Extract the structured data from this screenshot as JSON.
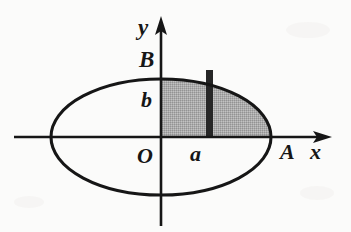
{
  "figure": {
    "background_color": "#fbfbfa",
    "ink_color": "#161616",
    "shade_color": "#a8a8a8",
    "strip_color": "#262626",
    "labels": {
      "y_axis": "y",
      "x_axis": "x",
      "origin": "O",
      "semi_minor": "b",
      "semi_major": "a",
      "top_vertex": "B",
      "right_vertex": "A"
    },
    "geometry": {
      "center_x": 161,
      "center_y": 137,
      "semi_axis_x": 110,
      "semi_axis_y": 58,
      "x_axis_start_x": 14,
      "x_axis_end_x": 332,
      "y_axis_top_y": 16,
      "y_axis_bottom_y": 226,
      "strip_left_x": 206,
      "strip_right_x": 213,
      "shaded_quadrant": "upper-right"
    }
  }
}
